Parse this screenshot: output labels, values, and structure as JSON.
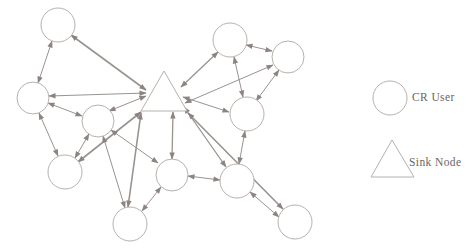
{
  "legend": {
    "items": [
      {
        "id": "cr-user",
        "shape": "circle",
        "label": "CR User"
      },
      {
        "id": "sink-node",
        "shape": "triangle",
        "label": "Sink Node"
      }
    ]
  },
  "colors": {
    "background": "#ffffff",
    "node_stroke": "#b6b2ac",
    "node_fill": "#ffffff",
    "edge": "#98948f",
    "arrow": "#8d8380",
    "label_text": "#6b655f"
  },
  "diagram": {
    "nodes": [
      {
        "id": "u1",
        "type": "cr-user",
        "x": 58,
        "y": 25,
        "r": 17
      },
      {
        "id": "u2",
        "type": "cr-user",
        "x": 33,
        "y": 98,
        "r": 16
      },
      {
        "id": "u3",
        "type": "cr-user",
        "x": 98,
        "y": 121,
        "r": 16
      },
      {
        "id": "u4",
        "type": "cr-user",
        "x": 65,
        "y": 172,
        "r": 17
      },
      {
        "id": "u5",
        "type": "cr-user",
        "x": 130,
        "y": 224,
        "r": 17
      },
      {
        "id": "u6",
        "type": "cr-user",
        "x": 172,
        "y": 175,
        "r": 16
      },
      {
        "id": "u7",
        "type": "cr-user",
        "x": 230,
        "y": 40,
        "r": 17
      },
      {
        "id": "u8",
        "type": "cr-user",
        "x": 288,
        "y": 57,
        "r": 16
      },
      {
        "id": "u9",
        "type": "cr-user",
        "x": 247,
        "y": 114,
        "r": 17
      },
      {
        "id": "u10",
        "type": "cr-user",
        "x": 237,
        "y": 181,
        "r": 17
      },
      {
        "id": "u11",
        "type": "cr-user",
        "x": 295,
        "y": 222,
        "r": 17
      },
      {
        "id": "sink",
        "type": "sink-node",
        "points": [
          [
            164,
            71
          ],
          [
            141,
            111
          ],
          [
            187,
            111
          ]
        ]
      }
    ],
    "edges": [
      {
        "from": "u1",
        "to": "sink",
        "x1": 71,
        "y1": 35,
        "x2": 146,
        "y2": 90,
        "w": 1.6
      },
      {
        "from": "u2",
        "to": "sink",
        "x1": 49,
        "y1": 96,
        "x2": 146,
        "y2": 93,
        "w": 1.0
      },
      {
        "from": "u3",
        "to": "sink",
        "x1": 109,
        "y1": 111,
        "x2": 146,
        "y2": 96,
        "w": 1.0
      },
      {
        "from": "u4",
        "to": "sink",
        "x1": 78,
        "y1": 162,
        "x2": 141,
        "y2": 112,
        "w": 1.6
      },
      {
        "from": "u5",
        "to": "sink",
        "x1": 128,
        "y1": 207,
        "x2": 141,
        "y2": 113,
        "w": 1.6
      },
      {
        "from": "u6",
        "to": "sink",
        "x1": 172,
        "y1": 159,
        "x2": 173,
        "y2": 112,
        "w": 1.3
      },
      {
        "from": "u7",
        "to": "sink",
        "x1": 218,
        "y1": 52,
        "x2": 181,
        "y2": 87,
        "w": 1.3
      },
      {
        "from": "u8",
        "to": "sink",
        "x1": 273,
        "y1": 65,
        "x2": 185,
        "y2": 103,
        "w": 1.0
      },
      {
        "from": "u9",
        "to": "sink",
        "x1": 229,
        "y1": 112,
        "x2": 183,
        "y2": 97,
        "w": 1.0
      },
      {
        "from": "u10",
        "to": "sink",
        "x1": 226,
        "y1": 167,
        "x2": 184,
        "y2": 107,
        "w": 1.3
      },
      {
        "from": "u11",
        "to": "sink",
        "x1": 283,
        "y1": 209,
        "x2": 188,
        "y2": 113,
        "w": 1.6
      },
      {
        "from": "u1",
        "to": "u2",
        "x1": 52,
        "y1": 41,
        "x2": 38,
        "y2": 83,
        "w": 1.0
      },
      {
        "from": "u2",
        "to": "u3",
        "x1": 48,
        "y1": 103,
        "x2": 82,
        "y2": 116,
        "w": 1.0
      },
      {
        "from": "u2",
        "to": "u4",
        "x1": 39,
        "y1": 113,
        "x2": 58,
        "y2": 156,
        "w": 1.0
      },
      {
        "from": "u3",
        "to": "u4",
        "x1": 89,
        "y1": 134,
        "x2": 75,
        "y2": 158,
        "w": 1.0
      },
      {
        "from": "u3",
        "to": "u5",
        "x1": 103,
        "y1": 136,
        "x2": 125,
        "y2": 208,
        "w": 1.0
      },
      {
        "from": "u3",
        "to": "u6",
        "x1": 111,
        "y1": 130,
        "x2": 158,
        "y2": 163,
        "w": 1.0
      },
      {
        "from": "u5",
        "to": "u6",
        "x1": 142,
        "y1": 211,
        "x2": 161,
        "y2": 187,
        "w": 1.0
      },
      {
        "from": "u6",
        "to": "u10",
        "x1": 188,
        "y1": 176,
        "x2": 220,
        "y2": 180,
        "w": 1.0
      },
      {
        "from": "u7",
        "to": "u8",
        "x1": 246,
        "y1": 45,
        "x2": 272,
        "y2": 51,
        "w": 1.0
      },
      {
        "from": "u7",
        "to": "u9",
        "x1": 234,
        "y1": 57,
        "x2": 243,
        "y2": 97,
        "w": 1.0
      },
      {
        "from": "u8",
        "to": "u9",
        "x1": 279,
        "y1": 70,
        "x2": 256,
        "y2": 101,
        "w": 1.0
      },
      {
        "from": "u9",
        "to": "u10",
        "x1": 245,
        "y1": 131,
        "x2": 239,
        "y2": 164,
        "w": 1.0
      },
      {
        "from": "u10",
        "to": "u11",
        "x1": 250,
        "y1": 192,
        "x2": 279,
        "y2": 217,
        "w": 1.0
      }
    ],
    "legend_shapes": [
      {
        "id": "legend-cr-user-shape",
        "type": "circle",
        "x": 390,
        "y": 98,
        "r": 17
      },
      {
        "id": "legend-sink-node-shape",
        "type": "triangle",
        "points": [
          [
            392,
            140
          ],
          [
            371,
            177
          ],
          [
            414,
            177
          ]
        ]
      }
    ]
  }
}
